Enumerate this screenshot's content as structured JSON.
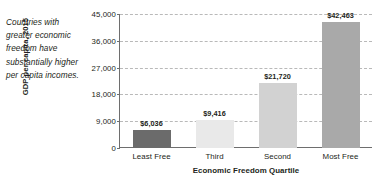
{
  "caption": "Countries with greater economic freedom have substantially higher per capita incomes.",
  "chart_data": {
    "type": "bar",
    "title": "",
    "subtitle": "",
    "categories": [
      "Least Free",
      "Third",
      "Second",
      "Most Free"
    ],
    "values": [
      6036,
      9416,
      21720,
      42463
    ],
    "value_labels": [
      "$6,036",
      "$9,416",
      "$21,720",
      "$42,463"
    ],
    "bar_colors": [
      "#6b6b6b",
      "#e9e9e9",
      "#d2d2d2",
      "#a9a9a9"
    ],
    "xlabel": "Economic Freedom Quartile",
    "ylabel": "GDP per capita, 2015",
    "ylim": [
      0,
      45000
    ],
    "yticks": [
      0,
      9000,
      18000,
      27000,
      36000,
      45000
    ],
    "ytick_labels": [
      "0",
      "9,000",
      "18,000",
      "27,000",
      "36,000",
      "45,000"
    ],
    "grid": true,
    "grid_axis": "y",
    "grid_style": "dashed",
    "grid_color": "#b9b9b9",
    "legend": false,
    "axis_color": "#6e6e6e",
    "background": "#ffffff"
  }
}
